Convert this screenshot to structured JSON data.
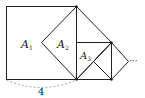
{
  "figure": {
    "labels": {
      "a1": {
        "main": "A",
        "sub": "1"
      },
      "a2": {
        "main": "A",
        "sub": "2"
      },
      "a3": {
        "main": "A",
        "sub": "3"
      }
    },
    "side_length_label": "4",
    "continuation": "···"
  },
  "colors": {
    "stroke": "#222222",
    "dashed_arc": "#888888"
  }
}
